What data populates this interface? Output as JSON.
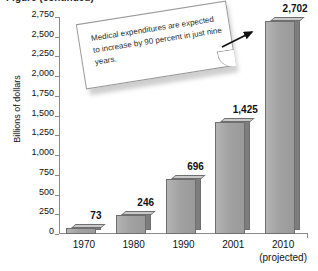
{
  "figure": {
    "title_cutoff": "Figure (continued)",
    "callout": {
      "text": "Medical expenditures are expected to increase by 90 percent in just nine years.",
      "arrow_target": "2010-bar-top"
    }
  },
  "chart_data": {
    "type": "bar",
    "title": "",
    "xlabel": "",
    "ylabel": "Billions of dollars",
    "categories": [
      "1970",
      "1980",
      "1990",
      "2001",
      "2010"
    ],
    "category_sublabels": [
      "",
      "",
      "",
      "",
      "(projected)"
    ],
    "values": [
      73,
      246,
      696,
      1425,
      2702
    ],
    "value_labels": [
      "73",
      "246",
      "696",
      "1,425",
      "2,702"
    ],
    "ylim": [
      0,
      2750
    ],
    "ytick_step": 250,
    "ytick_labels": [
      "2,750",
      "2,500",
      "2,250",
      "2,000",
      "1,750",
      "1,500",
      "1,250",
      "1,000",
      "750",
      "500",
      "250",
      "0"
    ],
    "ytick_values": [
      2750,
      2500,
      2250,
      2000,
      1750,
      1500,
      1250,
      1000,
      750,
      500,
      250,
      0
    ],
    "grid": false,
    "legend": false,
    "bar_style": "3d-extruded",
    "colors": {
      "bar_front": "#a2a2a2",
      "bar_side": "#7d7d7d",
      "bar_top": "#c9c9c9",
      "bar_outline": "#6f6f6f",
      "axis": "#8a8a8a",
      "text": "#111111",
      "callout_bg": "#ffffff",
      "callout_border": "#9a9a9a"
    }
  }
}
